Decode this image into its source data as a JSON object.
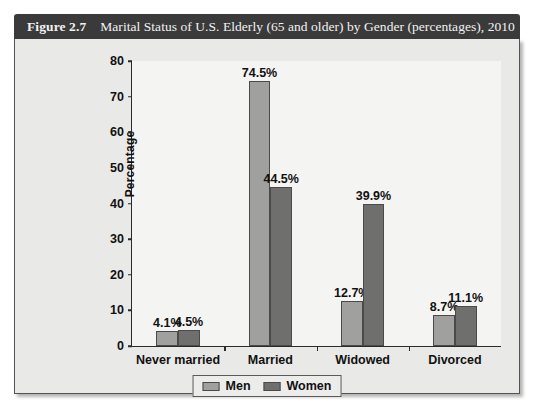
{
  "figure": {
    "number_label": "Figure 2.7",
    "caption": "Marital Status of U.S. Elderly (65 and older) by Gender (percentages), 2010"
  },
  "chart_data": {
    "type": "bar",
    "title": "Marital Status of U.S. Elderly (65 and older) by Gender (percentages), 2010",
    "categories": [
      "Never married",
      "Married",
      "Widowed",
      "Divorced"
    ],
    "series": [
      {
        "name": "Men",
        "color": "#a0a09e",
        "values": [
          4.1,
          74.5,
          12.7,
          8.7
        ],
        "labels": [
          "4.1%",
          "74.5%",
          "12.7%",
          "8.7%"
        ]
      },
      {
        "name": "Women",
        "color": "#6f6f6d",
        "values": [
          4.5,
          44.5,
          39.9,
          11.1
        ],
        "labels": [
          "4.5%",
          "44.5%",
          "39.9%",
          "11.1%"
        ]
      }
    ],
    "xlabel": "",
    "ylabel": "Percentage",
    "ylim": [
      0,
      80
    ],
    "ytick_step": 10,
    "yticks": [
      0,
      10,
      20,
      30,
      40,
      50,
      60,
      70,
      80
    ],
    "ytick_labels": [
      "0",
      "10",
      "20",
      "30",
      "40",
      "50",
      "60",
      "70",
      "80"
    ],
    "grid": false,
    "legend_position": "bottom-center",
    "legend_entries": [
      "Men",
      "Women"
    ]
  },
  "colors": {
    "title_bar_background": "#3a3a3a",
    "title_text": "#f2f2f2",
    "panel_background": "#e9e9e7",
    "plot_background": "#f4f4f2",
    "axis": "#2b2b2b",
    "men": "#a0a09e",
    "women": "#6f6f6d"
  }
}
